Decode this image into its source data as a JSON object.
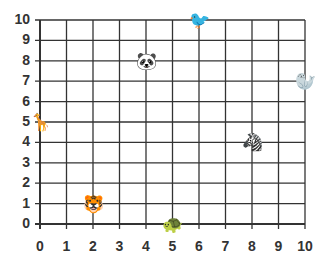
{
  "grid": {
    "title": "",
    "x_ticks": [
      "0",
      "1",
      "2",
      "3",
      "4",
      "5",
      "6",
      "7",
      "8",
      "9",
      "10"
    ],
    "y_ticks": [
      "0",
      "1",
      "2",
      "3",
      "4",
      "5",
      "6",
      "7",
      "8",
      "9",
      "10"
    ],
    "x_range": [
      0,
      10
    ],
    "y_range": [
      0,
      10
    ],
    "line_color": "#333333"
  },
  "animals": [
    {
      "name": "giraffe",
      "x": 0,
      "y": 5,
      "glyph": "🦒"
    },
    {
      "name": "panda",
      "x": 4,
      "y": 8,
      "glyph": "🐼"
    },
    {
      "name": "bird",
      "x": 6,
      "y": 10,
      "glyph": "🐦"
    },
    {
      "name": "seal",
      "x": 10,
      "y": 7,
      "glyph": "🦭"
    },
    {
      "name": "zebra",
      "x": 8,
      "y": 4,
      "glyph": "🦓"
    },
    {
      "name": "tiger",
      "x": 2,
      "y": 1,
      "glyph": "🐯"
    },
    {
      "name": "turtle",
      "x": 5,
      "y": 0,
      "glyph": "🐢"
    }
  ]
}
